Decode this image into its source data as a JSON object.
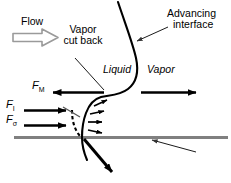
{
  "figure": {
    "type": "schematic-diagram",
    "background_color": "#ffffff",
    "line_color": "#000000",
    "wall_color": "#808080",
    "flow_arrow_color": "#999999"
  },
  "labels": {
    "flow": "Flow",
    "vapor_cut_back_line1": "Vapor",
    "vapor_cut_back_line2": "cut back",
    "advancing_line1": "Advancing",
    "advancing_line2": "interface",
    "liquid": "Liquid",
    "vapor": "Vapor",
    "force_momentum_symbol": "F",
    "force_momentum_sub": "M",
    "force_inertia_symbol": "F",
    "force_inertia_sub": "I",
    "force_surface_symbol": "F",
    "force_surface_sub": "σ"
  },
  "annotations": {
    "flow_arrow": "hollow-right-arrow",
    "momentum_arrow_direction": "left",
    "inertia_arrow_direction": "right",
    "surface_tension_arrow_direction": "right",
    "vapor_arrow_direction": "right",
    "evaporation_arrows_count": 4,
    "microlayer_arrow_direction": "down-right",
    "wall_leader_direction": "left"
  }
}
